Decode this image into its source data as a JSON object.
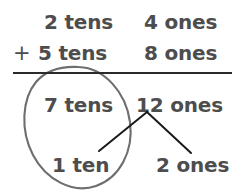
{
  "worksheet": {
    "kind": "place-value-addition-regrouping",
    "operator": "+",
    "colors": {
      "text": "#4d4d4d",
      "rule": "#2b2b2b",
      "circle": "#6e6e6e",
      "branch": "#1a1a1a",
      "background": "#ffffff"
    },
    "rows": {
      "addend1": {
        "tens": "2 tens",
        "ones": "4 ones"
      },
      "addend2": {
        "tens": "5 tens",
        "ones": "8 ones"
      },
      "sum": {
        "tens": "7 tens",
        "ones": "12 ones"
      },
      "decomposition": {
        "tens": "1 ten",
        "ones": "2 ones"
      }
    },
    "annotations": {
      "circle_label": "circled-tens-group",
      "branch_label": "decomposition-branch"
    }
  }
}
